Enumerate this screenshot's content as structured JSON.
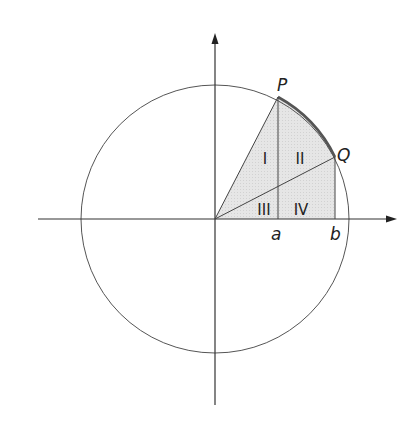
{
  "diagram": {
    "type": "unit-circle-sector",
    "colors": {
      "background": "#ffffff",
      "line": "#444444",
      "arc_highlight": "#555555",
      "region_fill": "#e4e4e4",
      "text": "#222222"
    },
    "points": {
      "P": {
        "label": "P"
      },
      "Q": {
        "label": "Q"
      }
    },
    "axis_marks": {
      "a": {
        "label": "a"
      },
      "b": {
        "label": "b"
      }
    },
    "regions": [
      {
        "id": "I",
        "label": "I"
      },
      {
        "id": "II",
        "label": "II"
      },
      {
        "id": "III",
        "label": "III"
      },
      {
        "id": "IV",
        "label": "IV"
      }
    ]
  }
}
